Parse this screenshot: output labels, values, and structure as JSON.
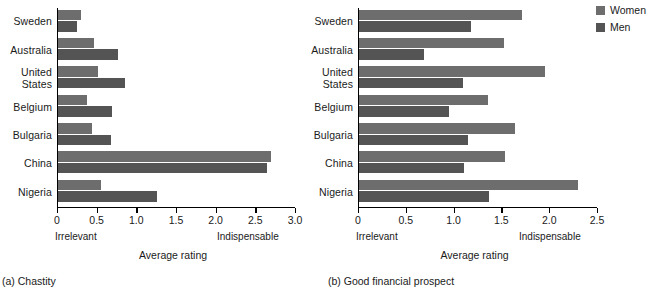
{
  "legend": {
    "position": "top-right",
    "items": [
      {
        "label": "Women",
        "color": "#6d6d6d",
        "name": "women"
      },
      {
        "label": "Men",
        "color": "#545454",
        "name": "men"
      }
    ]
  },
  "panels": [
    {
      "id": "a",
      "caption": "(a) Chastity",
      "axis_title": "Average rating",
      "low_label": "Irrelevant",
      "high_label": "Indispensable",
      "ticks": [
        "0",
        "0.5",
        "1.0",
        "1.5",
        "2.0",
        "2.5",
        "3.0"
      ]
    },
    {
      "id": "b",
      "caption": "(b) Good financial prospect",
      "axis_title": "Average rating",
      "low_label": "Irrelevant",
      "high_label": "Indispensable",
      "ticks": [
        "0",
        "0.5",
        "1.0",
        "1.5",
        "2.0",
        "2.5"
      ]
    }
  ],
  "chart_data": [
    {
      "type": "bar",
      "orientation": "horizontal",
      "title": "(a) Chastity",
      "xlabel": "Average rating",
      "ylabel": "",
      "xlim": [
        0,
        3.0
      ],
      "xticks": [
        0,
        0.5,
        1.0,
        1.5,
        2.0,
        2.5,
        3.0
      ],
      "xtick_labels": [
        "0",
        "0.5",
        "1.0",
        "1.5",
        "2.0",
        "2.5",
        "3.0"
      ],
      "x_low_anchor": "Irrelevant",
      "x_high_anchor": "Indispensable",
      "grid": false,
      "legend": [
        "Women",
        "Men"
      ],
      "categories": [
        "Sweden",
        "Australia",
        "United\nStates",
        "Belgium",
        "Bulgaria",
        "China",
        "Nigeria"
      ],
      "series": [
        {
          "name": "Women",
          "color": "#6d6d6d",
          "values": [
            0.29,
            0.46,
            0.51,
            0.36,
            0.43,
            2.69,
            0.54
          ]
        },
        {
          "name": "Men",
          "color": "#545454",
          "values": [
            0.24,
            0.76,
            0.84,
            0.68,
            0.67,
            2.63,
            1.25
          ]
        }
      ]
    },
    {
      "type": "bar",
      "orientation": "horizontal",
      "title": "(b) Good financial prospect",
      "xlabel": "Average rating",
      "ylabel": "",
      "xlim": [
        0,
        2.5
      ],
      "xticks": [
        0,
        0.5,
        1.0,
        1.5,
        2.0,
        2.5
      ],
      "xtick_labels": [
        "0",
        "0.5",
        "1.0",
        "1.5",
        "2.0",
        "2.5"
      ],
      "x_low_anchor": "Irrelevant",
      "x_high_anchor": "Indispensable",
      "grid": false,
      "legend": [
        "Women",
        "Men"
      ],
      "categories": [
        "Sweden",
        "Australia",
        "United\nStates",
        "Belgium",
        "Bulgaria",
        "China",
        "Nigeria"
      ],
      "series": [
        {
          "name": "Women",
          "color": "#6d6d6d",
          "values": [
            1.71,
            1.52,
            1.95,
            1.35,
            1.63,
            1.53,
            2.29
          ]
        },
        {
          "name": "Men",
          "color": "#545454",
          "values": [
            1.17,
            0.68,
            1.09,
            0.94,
            1.14,
            1.1,
            1.36
          ]
        }
      ]
    }
  ]
}
